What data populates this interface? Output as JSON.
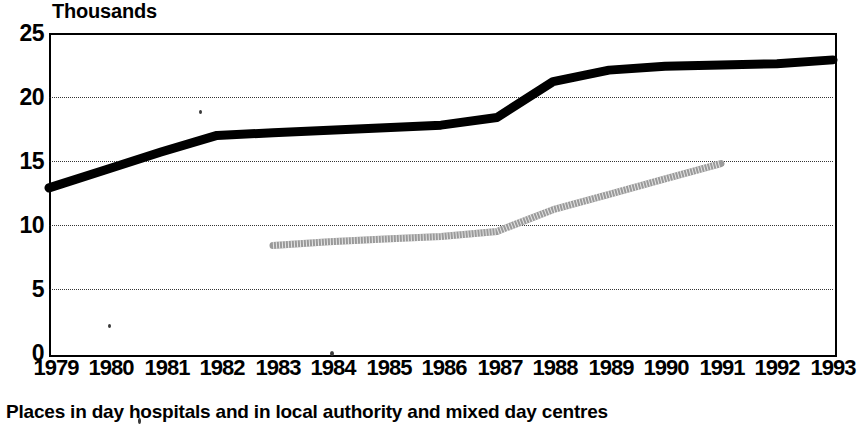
{
  "units_label": "Thousands",
  "caption": "Places in day hospitals and in local authority and mixed day centres",
  "axis": {
    "y_ticks": [
      "25",
      "20",
      "15",
      "10",
      "5",
      "0"
    ],
    "x_ticks": [
      "1979",
      "1980",
      "1981",
      "1982",
      "1983",
      "1984",
      "1985",
      "1986",
      "1987",
      "1988",
      "1989",
      "1990",
      "1991",
      "1992",
      "1993"
    ]
  },
  "colors": {
    "dark_series": "#000000",
    "light_series": "#9a9a9a",
    "axis": "#000000",
    "gridline": "#111111",
    "background": "#ffffff"
  },
  "chart_data": {
    "type": "line",
    "title": "",
    "subtitle": "",
    "xlabel": "",
    "ylabel": "Thousands",
    "ylim": [
      0,
      25
    ],
    "y_ticks": [
      0,
      5,
      10,
      15,
      20,
      25
    ],
    "grid": true,
    "grid_axis": "y",
    "legend": "none",
    "x": [
      1979,
      1980,
      1981,
      1982,
      1983,
      1984,
      1985,
      1986,
      1987,
      1988,
      1989,
      1990,
      1991,
      1992,
      1993
    ],
    "series": [
      {
        "name": "Day hospitals and day centres (total)",
        "style": "thick solid black",
        "values": [
          12.9,
          14.3,
          15.7,
          17.0,
          17.2,
          17.4,
          17.6,
          17.8,
          18.4,
          21.2,
          22.1,
          22.4,
          22.5,
          22.6,
          22.9
        ]
      },
      {
        "name": "Local authority and mixed day centres",
        "style": "thin speckled grey",
        "x_start": 1983,
        "x_end": 1991,
        "values": [
          null,
          null,
          null,
          null,
          8.4,
          8.7,
          8.9,
          9.1,
          9.5,
          11.2,
          12.4,
          13.6,
          14.8,
          null,
          null
        ]
      }
    ]
  }
}
